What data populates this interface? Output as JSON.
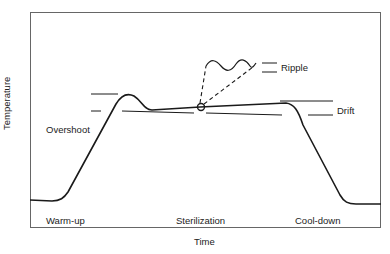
{
  "diagram": {
    "title": "",
    "axes": {
      "xlabel": "Time",
      "ylabel": "Temperature"
    },
    "phases": [
      {
        "label": "Warm-up"
      },
      {
        "label": "Sterilization"
      },
      {
        "label": "Cool-down"
      }
    ],
    "annotations": {
      "overshoot": "Overshoot",
      "ripple": "Ripple",
      "drift": "Drift"
    },
    "colors": {
      "line": "#1a1a1a",
      "frame": "#555555",
      "background": "#ffffff"
    }
  }
}
